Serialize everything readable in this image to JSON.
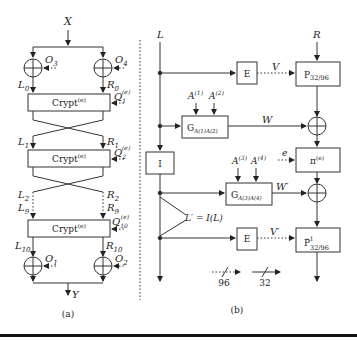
{
  "panel_a": {
    "caption": "(a)",
    "input": "X",
    "output": "Y",
    "xor_labels": {
      "o3": "O",
      "o3_sub": "3",
      "o4": "O",
      "o4_sub": "4",
      "o1": "O",
      "o1_sub": "1",
      "o2": "O",
      "o2_sub": "2"
    },
    "wire_labels": {
      "l0": "L",
      "l0_sub": "0",
      "r0": "R",
      "r0_sub": "0",
      "l1": "L",
      "l1_sub": "1",
      "r1": "R",
      "r1_sub": "1",
      "l2": "L",
      "l2_sub": "2",
      "r2": "R",
      "r2_sub": "2",
      "l9": "L",
      "l9_sub": "9",
      "r9": "R",
      "r9_sub": "9",
      "l10": "L",
      "l10_sub": "10",
      "r10": "R",
      "r10_sub": "10"
    },
    "crypt_boxes": [
      {
        "label": "Crypt",
        "sup": "(e)",
        "key": "Q",
        "key_sub": "1",
        "key_sup": "(e)"
      },
      {
        "label": "Crypt",
        "sup": "(e)",
        "key": "Q",
        "key_sub": "2",
        "key_sup": "(e)"
      },
      {
        "label": "Crypt",
        "sup": "(e)",
        "key": "Q",
        "key_sub": "10",
        "key_sup": "(e)"
      }
    ]
  },
  "panel_b": {
    "caption": "(b)",
    "inputs": {
      "left": "L",
      "right": "R"
    },
    "boxes": {
      "e_top": "E",
      "p_top": "P",
      "p_top_sub": "32/96",
      "g1": "G",
      "g1_sub": "A(1)A(2)",
      "i_box": "I",
      "pi": "π",
      "pi_sup": "(e)",
      "g2": "G",
      "g2_sub": "A(3)A(4)",
      "e_bottom": "E",
      "p_bottom": "P",
      "p_bottom_sub": "32/96",
      "p_bottom_sup": "−1"
    },
    "params": {
      "a1": "A",
      "a1_sup": "(1)",
      "a2": "A",
      "a2_sup": "(2)",
      "a3": "A",
      "a3_sup": "(3)",
      "a4": "A",
      "a4_sup": "(4)",
      "e": "e"
    },
    "wire_labels": {
      "v": "V",
      "w": "W",
      "w_prime": "W′",
      "v_prime": "V′",
      "l_prime": "L′ = I(L)"
    },
    "legend": [
      {
        "style": "dotted",
        "label": "96"
      },
      {
        "style": "solid",
        "label": "32"
      }
    ]
  }
}
